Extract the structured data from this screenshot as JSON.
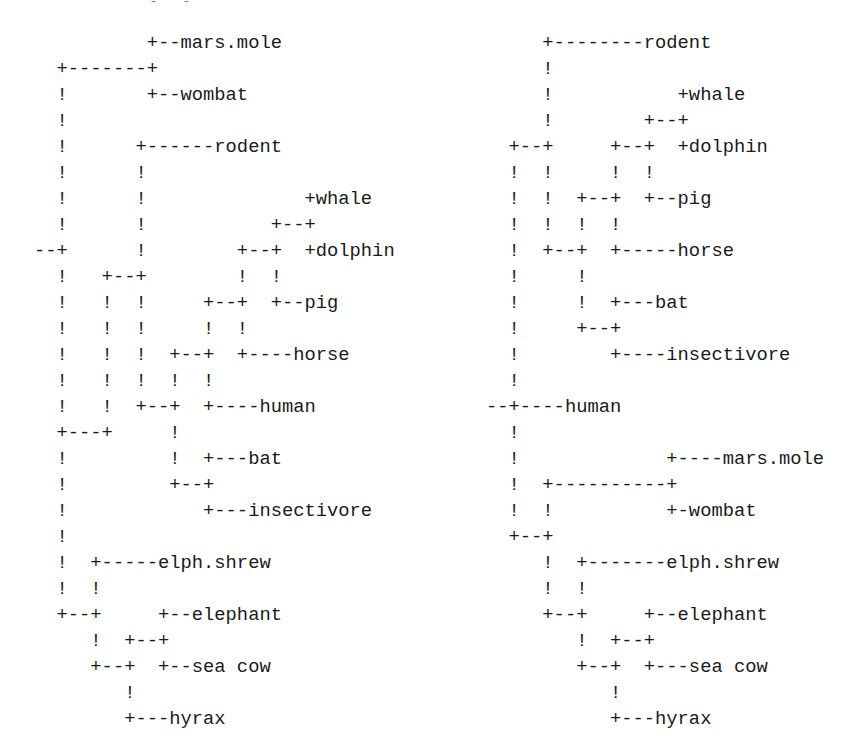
{
  "trees": {
    "left": {
      "rows": [
        "          +--mars.mole",
        "  +-------+",
        "  !       +--wombat",
        "  !",
        "  !      +------rodent",
        "  !      !",
        "  !      !              +whale",
        "  !      !           +--+",
        "--+      !        +--+  +dolphin",
        "  !   +--+        !  !",
        "  !   !  !     +--+  +--pig",
        "  !   !  !     !  !",
        "  !   !  !  +--+  +----horse",
        "  !   !  !  !  !",
        "  !   !  +--+  +----human",
        "  +---+     !",
        "  !         !  +---bat",
        "  !         +--+",
        "  !            +---insectivore",
        "  !",
        "  !  +-----elph.shrew",
        "  !  !",
        "  +--+     +--elephant",
        "     !  +--+",
        "     +--+  +--sea cow",
        "        !",
        "        +---hyrax"
      ],
      "leaves": [
        "mars.mole",
        "wombat",
        "rodent",
        "whale",
        "dolphin",
        "pig",
        "horse",
        "human",
        "bat",
        "insectivore",
        "elph.shrew",
        "elephant",
        "sea cow",
        "hyrax"
      ]
    },
    "right": {
      "rows": [
        "     +--------rodent",
        "     !",
        "     !           +whale",
        "     !        +--+",
        "  +--+     +--+  +dolphin",
        "  !  !     !  !",
        "  !  !  +--+  +--pig",
        "  !  !  !  !",
        "  !  +--+  +-----horse",
        "  !     !",
        "  !     !  +---bat",
        "  !     +--+",
        "  !        +----insectivore",
        "  !",
        "--+----human",
        "  !",
        "  !             +----mars.mole",
        "  !  +----------+",
        "  !  !          +-wombat",
        "  +--+",
        "     !  +-------elph.shrew",
        "     !  !",
        "     +--+     +--elephant",
        "        !  +--+",
        "        +--+  +---sea cow",
        "           !",
        "           +---hyrax"
      ],
      "leaves": [
        "rodent",
        "whale",
        "dolphin",
        "pig",
        "horse",
        "bat",
        "insectivore",
        "human",
        "mars.mole",
        "wombat",
        "elph.shrew",
        "elephant",
        "sea cow",
        "hyrax"
      ]
    }
  }
}
